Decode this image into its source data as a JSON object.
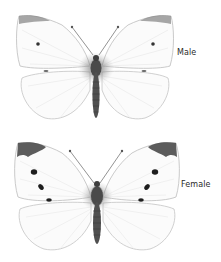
{
  "figures": [
    {
      "label": "Male",
      "spots": "one small dark spot per forewing, grey wing tips"
    },
    {
      "label": "Female",
      "spots": "two dark spots and a dash per forewing, darker wing tips"
    }
  ],
  "colors": {
    "background": "#ffffff",
    "wing_fill": "#fbfbfb",
    "wing_outline": "#bdbdbd",
    "wing_tip": "#7a7a7a",
    "spot": "#1e1e1e",
    "body": "#4a4a4a",
    "label_text": "#2a2a2a"
  }
}
